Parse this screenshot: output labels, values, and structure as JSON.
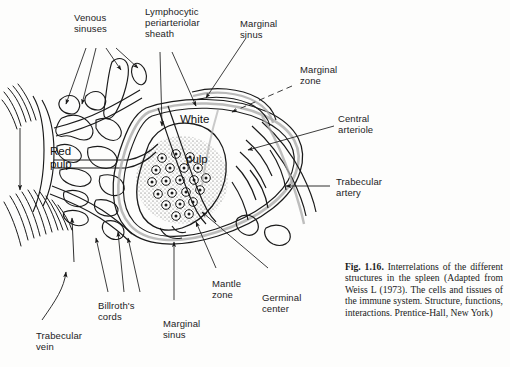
{
  "figure": {
    "caption_number": "Fig. 1.16.",
    "caption_body": " Interrelations of the dif­ferent structures in the spleen (Adapted from Weiss L (1973). The cells and tissues of the immune system. Structure, functions, interactions. Prentice-Hall, New York)"
  },
  "labels": {
    "venous_sinuses": "Venous\nsinuses",
    "lymphocytic_periarteriolar_sheath": "Lymphocytic\nperiarteriolar\nsheath",
    "marginal_sinus_top": "Marginal\nsinus",
    "marginal_zone": "Marginal\nzone",
    "central_arteriole": "Central\narteriole",
    "trabecular_artery": "Trabecular\nartery",
    "white_pulp_line1": "White",
    "white_pulp_line2": "pulp",
    "red_pulp": "Red\npulp",
    "trabecular_vein": "Trabecular\nvein",
    "billroths_cords": "Billroth's\ncords",
    "marginal_sinus_bottom": "Marginal\nsinus",
    "mantle_zone": "Mantle\nzone",
    "germinal_center": "Germinal\ncenter"
  },
  "colors": {
    "ink": "#1a1a1a",
    "page": "#fdfdfc",
    "stipple": "#2a2a2a",
    "shade": "#9a9a9a"
  }
}
